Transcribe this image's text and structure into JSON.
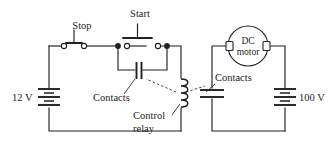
{
  "diagram": {
    "stroke_color": "#231f20",
    "background": "#ffffff",
    "labels": {
      "stop": "Stop",
      "start": "Start",
      "contacts_left": "Contacts",
      "control_relay_line1": "Control",
      "control_relay_line2": "relay",
      "contacts_right": "Contacts",
      "motor_line1": "DC",
      "motor_line2": "motor",
      "battery_left": "12 V",
      "battery_right": "100 V"
    },
    "components": [
      {
        "name": "stop-switch",
        "type": "normally-closed-pushbutton",
        "label": "Stop"
      },
      {
        "name": "start-switch",
        "type": "normally-open-pushbutton",
        "label": "Start"
      },
      {
        "name": "holding-contacts",
        "type": "relay-contact",
        "label": "Contacts"
      },
      {
        "name": "control-relay-coil",
        "type": "coil",
        "label": "Control relay"
      },
      {
        "name": "power-contacts",
        "type": "relay-contact",
        "label": "Contacts"
      },
      {
        "name": "dc-motor",
        "type": "motor",
        "label": "DC motor"
      },
      {
        "name": "battery-12v",
        "type": "battery",
        "label": "12 V"
      },
      {
        "name": "battery-100v",
        "type": "battery",
        "label": "100 V"
      }
    ]
  }
}
